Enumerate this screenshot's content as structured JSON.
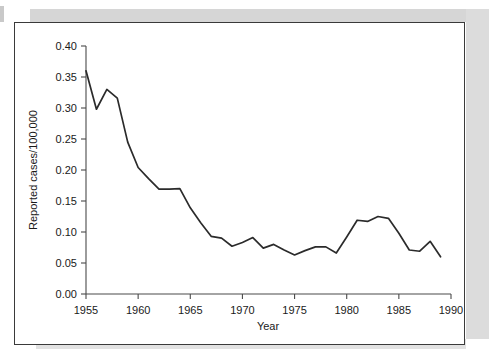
{
  "figure": {
    "frame_color": "#3a3a3a",
    "background": "#ffffff"
  },
  "chart_data": {
    "type": "line",
    "title": "",
    "subtitle": "",
    "xlabel": "Year",
    "ylabel": "Reported cases/100,000",
    "xlim": [
      1955,
      1990
    ],
    "ylim": [
      0.0,
      0.4
    ],
    "xticks": [
      1955,
      1960,
      1965,
      1970,
      1975,
      1980,
      1985,
      1990
    ],
    "xtick_labels": [
      "1955",
      "1960",
      "1965",
      "1970",
      "1975",
      "1980",
      "1985",
      "1990"
    ],
    "yticks": [
      0.0,
      0.05,
      0.1,
      0.15,
      0.2,
      0.25,
      0.3,
      0.35,
      0.4
    ],
    "ytick_labels": [
      "0.00",
      "0.05",
      "0.10",
      "0.15",
      "0.20",
      "0.25",
      "0.30",
      "0.35",
      "0.40"
    ],
    "grid": false,
    "legend": null,
    "legend_position": "none",
    "line_color": "#2b2b2b",
    "x": [
      1955,
      1956,
      1957,
      1958,
      1959,
      1960,
      1961,
      1962,
      1963,
      1964,
      1965,
      1966,
      1967,
      1968,
      1969,
      1970,
      1971,
      1972,
      1973,
      1974,
      1975,
      1976,
      1977,
      1978,
      1979,
      1980,
      1981,
      1982,
      1983,
      1984,
      1985,
      1986,
      1987,
      1988,
      1989
    ],
    "series": [
      {
        "name": "Reported cases/100,000",
        "values": [
          0.36,
          0.298,
          0.33,
          0.316,
          0.245,
          0.204,
          0.186,
          0.169,
          0.169,
          0.17,
          0.139,
          0.115,
          0.093,
          0.09,
          0.077,
          0.083,
          0.091,
          0.074,
          0.08,
          0.071,
          0.063,
          0.07,
          0.076,
          0.076,
          0.066,
          0.092,
          0.119,
          0.117,
          0.125,
          0.122,
          0.098,
          0.071,
          0.069,
          0.085,
          0.06
        ]
      }
    ]
  },
  "axis_pixels": {
    "note": "calibration used by template",
    "x_left_px": 71,
    "x_right_px": 436,
    "y_top_px": 23,
    "y_bottom_px": 271
  }
}
